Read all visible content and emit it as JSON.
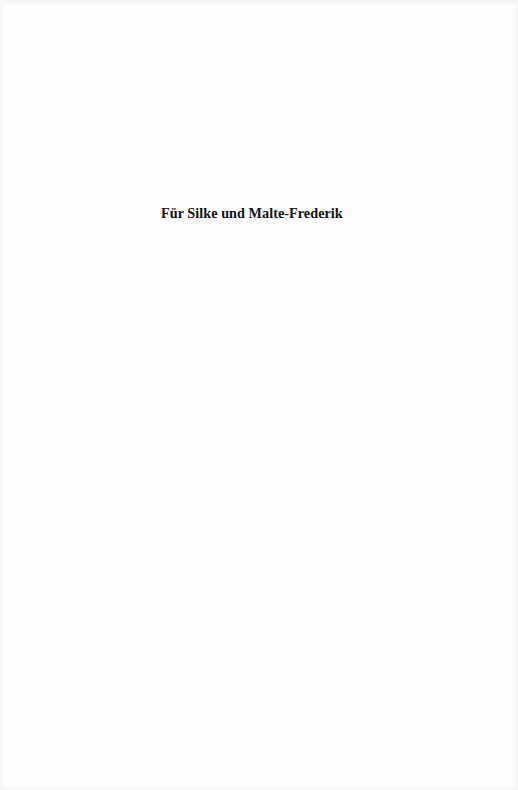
{
  "page": {
    "dedication": "Für Silke und Malte-Frederik"
  },
  "colors": {
    "background": "#fefefe",
    "text": "#111111"
  }
}
